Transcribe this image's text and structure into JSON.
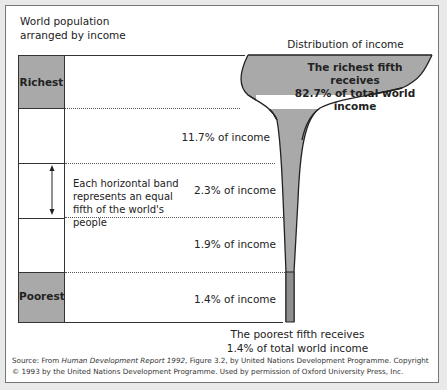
{
  "diagram": {
    "left_title": "World population arranged by income",
    "right_title": "Distribution of income",
    "bands": [
      {
        "label": "Richest",
        "income_label": "The richest fifth receives 82.7% of total world income",
        "share_pct": 82.7,
        "shaded": true
      },
      {
        "label": "",
        "income_label": "11.7% of income",
        "share_pct": 11.7,
        "shaded": false
      },
      {
        "label": "",
        "income_label": "2.3% of income",
        "share_pct": 2.3,
        "shaded": false
      },
      {
        "label": "",
        "income_label": "1.9% of income",
        "share_pct": 1.9,
        "shaded": false
      },
      {
        "label": "Poorest",
        "income_label": "1.4% of income",
        "share_pct": 1.4,
        "shaded": true
      }
    ],
    "band_note": "Each horizontal band represents an equal fifth of the world's people",
    "poorest_note_line1": "The poorest fifth receives",
    "poorest_note_line2": "1.4% of total world income",
    "richest_note_line1": "The richest fifth receives",
    "richest_note_line2": "82.7% of total world",
    "richest_note_line3": "income",
    "colors": {
      "shade": "#a9a9a9",
      "line": "#333333",
      "frame": "#777777"
    }
  },
  "source": {
    "prefix": "Source: From ",
    "title": "Human Development Report 1992",
    "suffix": ", Figure 3.2, by United Nations Development Programme. Copyright © 1993 by the United Nations Development Programme. Used by permission of Oxford University Press, Inc."
  }
}
